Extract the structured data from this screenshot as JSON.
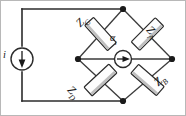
{
  "figure": {
    "kind": "circuit-schematic",
    "background_color": "#ffffff",
    "line_color": "#2b2b2b",
    "frame_color": "#b8b8b8",
    "node_color": "#1a1a1a",
    "component_fill": "#fdfdfd",
    "component_shade": "#a8a8a8"
  },
  "labels": {
    "impedance_upper_left": {
      "symbol": "Z",
      "subscript": "C"
    },
    "impedance_upper_right": {
      "symbol": "Z",
      "subscript": "A"
    },
    "impedance_lower_left": {
      "symbol": "Z",
      "subscript": "D"
    },
    "impedance_lower_right": {
      "symbol": "Z",
      "subscript": "B"
    },
    "bridge_source": {
      "symbol": "α",
      "subscript": "i"
    },
    "supply_source": {
      "symbol": "i",
      "subscript": ""
    }
  },
  "components": [
    {
      "name": "current-source-left",
      "type": "current-source",
      "arrow_direction": "down",
      "label": "i"
    },
    {
      "name": "impedance-zc",
      "type": "impedance",
      "position": "upper-left-arm",
      "label": "Z_C"
    },
    {
      "name": "impedance-za",
      "type": "impedance",
      "position": "upper-right-arm",
      "label": "Z_A"
    },
    {
      "name": "impedance-zd",
      "type": "impedance",
      "position": "lower-left-arm",
      "label": "Z_D"
    },
    {
      "name": "impedance-zb",
      "type": "impedance",
      "position": "lower-right-arm",
      "label": "Z_B"
    },
    {
      "name": "bridge-source",
      "type": "current-source",
      "arrow_direction": "right",
      "label": "alpha_i"
    }
  ],
  "nodes": [
    {
      "name": "node-top",
      "x": 123,
      "y": 9
    },
    {
      "name": "node-left",
      "x": 78,
      "y": 59
    },
    {
      "name": "node-right",
      "x": 172,
      "y": 59
    },
    {
      "name": "node-bottom",
      "x": 123,
      "y": 101
    }
  ]
}
